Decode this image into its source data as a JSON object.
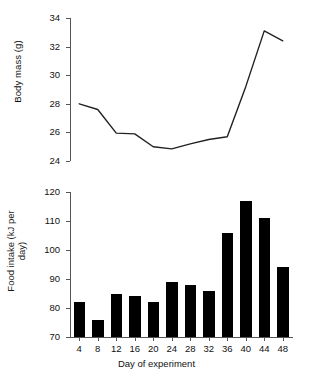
{
  "figure": {
    "panels": [
      "body-mass",
      "food-intake"
    ]
  },
  "chart_data": [
    {
      "type": "line",
      "title": "",
      "xlabel": "",
      "ylabel": "Body mass (g)",
      "x": [
        4,
        8,
        12,
        16,
        20,
        24,
        28,
        32,
        36,
        40,
        44,
        48
      ],
      "values": [
        28.0,
        27.6,
        25.95,
        25.9,
        25.0,
        24.85,
        25.2,
        25.5,
        25.7,
        29.2,
        33.1,
        32.4
      ],
      "ylim": [
        24,
        34
      ],
      "yticks": [
        24,
        26,
        28,
        30,
        32,
        34
      ],
      "yticklabels": [
        "24",
        "26",
        "28",
        "30",
        "32",
        "34"
      ],
      "xlim": [
        2,
        50
      ],
      "grid": false,
      "legend": false,
      "line_color": "#222222"
    },
    {
      "type": "bar",
      "title": "",
      "xlabel": "Day of experiment",
      "ylabel": "Food intake (kJ per day)",
      "categories": [
        "4",
        "8",
        "12",
        "16",
        "20",
        "24",
        "28",
        "32",
        "36",
        "40",
        "44",
        "48"
      ],
      "values": [
        82,
        76,
        85,
        84,
        82,
        89,
        88,
        86,
        106,
        117,
        111,
        94
      ],
      "ylim": [
        70,
        120
      ],
      "yticks": [
        70,
        80,
        90,
        100,
        110,
        120
      ],
      "yticklabels": [
        "70",
        "80",
        "90",
        "100",
        "110",
        "120"
      ],
      "xticklabels": [
        "4",
        "8",
        "12",
        "16",
        "20",
        "24",
        "28",
        "32",
        "36",
        "40",
        "44",
        "48"
      ],
      "grid": false,
      "legend": false,
      "bar_color": "#000000"
    }
  ],
  "labels": {
    "ylabel_top": "Body mass (g)",
    "ylabel_bottom_line1": "Food intake (kJ per",
    "ylabel_bottom_line2": "day)",
    "xlabel": "Day of experiment"
  }
}
